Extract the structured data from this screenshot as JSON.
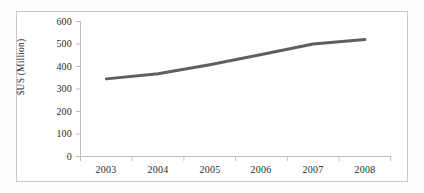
{
  "chart_data": {
    "type": "line",
    "title": "",
    "subtitle": "",
    "xlabel": "",
    "ylabel": "$US (Million)",
    "categories": [
      "2003",
      "2004",
      "2005",
      "2006",
      "2007",
      "2008"
    ],
    "x": [
      2003,
      2004,
      2005,
      2006,
      2007,
      2008
    ],
    "values": [
      345,
      368,
      408,
      453,
      500,
      520
    ],
    "series": [
      {
        "name": "$US (Million)",
        "values": [
          345,
          368,
          408,
          453,
          500,
          520
        ],
        "color": "#5f5f5f",
        "line_width": 3,
        "markers": false
      }
    ],
    "ylim": [
      0,
      600
    ],
    "yticks": [
      0,
      100,
      200,
      300,
      400,
      500,
      600
    ],
    "ytick_labels": [
      "0",
      "100",
      "200",
      "300",
      "400",
      "500",
      "600"
    ],
    "xtick_labels": [
      "2003",
      "2004",
      "2005",
      "2006",
      "2007",
      "2008"
    ],
    "grid": false,
    "legend": false,
    "legend_position": "none",
    "annotations": []
  },
  "figure": {
    "background_color": "#ffffff",
    "frame_color": "#c9c9c9",
    "axis_color": "#bfbfbf",
    "text_color": "#2b2b2b",
    "line_color": "#5f5f5f"
  }
}
